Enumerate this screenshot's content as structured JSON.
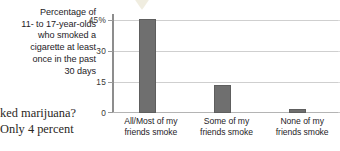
{
  "caption": {
    "lines": [
      "Percentage of",
      "11- to 17-year-olds",
      "who smoked a",
      "cigarette at least",
      "once in the past",
      "30 days"
    ]
  },
  "body_text": {
    "lines": [
      "ked marijuana?",
      "Only 4 percent"
    ]
  },
  "colors": {
    "bar": "#6f6f6f",
    "gridline": "#cfcfcf",
    "axis": "#8d8d8d",
    "text": "#25221f",
    "background": "#ffffff"
  },
  "chart_data": {
    "type": "bar",
    "title": "Percentage of 11- to 17-year-olds who smoked a cigarette at least once in the past 30 days",
    "xlabel": "",
    "ylabel": "",
    "categories": [
      "All/Most of my friends smoke",
      "Some of my friends smoke",
      "None of my friends smoke"
    ],
    "category_lines": [
      [
        "All/Most of my",
        "friends smoke"
      ],
      [
        "Some of my",
        "friends smoke"
      ],
      [
        "None of my",
        "friends smoke"
      ]
    ],
    "values": [
      43,
      13,
      2
    ],
    "ylim": [
      0,
      45
    ],
    "yticks": [
      0,
      15,
      30,
      45
    ],
    "ytick_labels": [
      "0",
      "15",
      "30",
      "45%"
    ],
    "grid": true,
    "legend": "none",
    "bar_color": "#6f6f6f"
  }
}
